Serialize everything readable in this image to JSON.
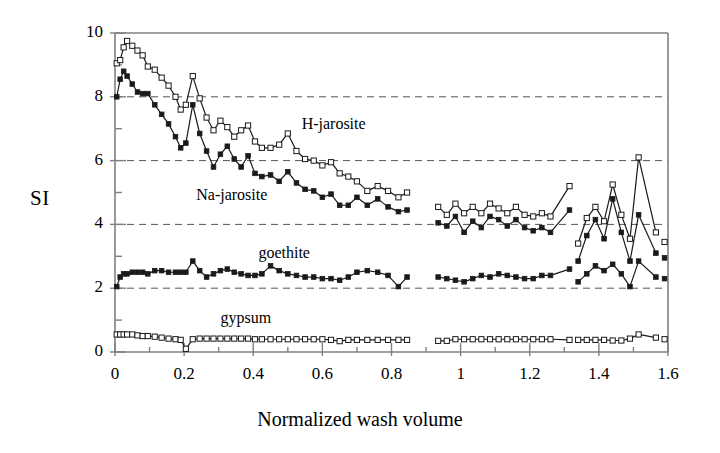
{
  "chart_data": {
    "type": "line",
    "title": "",
    "xlabel": "Normalized wash volume",
    "ylabel": "SI",
    "xlim": [
      0,
      1.6
    ],
    "ylim": [
      0,
      10
    ],
    "xticks": [
      0,
      0.1,
      0.2,
      0.3,
      0.4,
      0.5,
      0.6,
      0.7,
      0.8,
      0.9,
      1.0,
      1.1,
      1.2,
      1.3,
      1.4,
      1.5,
      1.6
    ],
    "xtick_labels": [
      "0",
      "",
      "0.2",
      "",
      "0.4",
      "",
      "0.6",
      "",
      "0.8",
      "",
      "1",
      "",
      "1.2",
      "",
      "1.4",
      "",
      "1.6"
    ],
    "yticks": [
      0,
      1,
      2,
      3,
      4,
      5,
      6,
      7,
      8,
      9,
      10
    ],
    "ytick_labels": [
      "0",
      "",
      "2",
      "",
      "4",
      "",
      "6",
      "",
      "8",
      "",
      "10"
    ],
    "grid": "horizontal dashed at y = 2, 4, 6, 8",
    "gridlines_y": [
      2,
      4,
      6,
      8
    ],
    "legend": "inline annotations next to each curve",
    "marker_note": "open squares = H-jarosite and gypsum; filled squares = Na-jarosite and goethite",
    "series": [
      {
        "name": "H-jarosite",
        "marker": "open-square",
        "label_x": 0.54,
        "label_y": 7.1,
        "x": [
          0.005,
          0.015,
          0.025,
          0.035,
          0.05,
          0.065,
          0.08,
          0.095,
          0.115,
          0.135,
          0.155,
          0.175,
          0.19,
          0.205,
          0.225,
          0.245,
          0.265,
          0.285,
          0.305,
          0.325,
          0.345,
          0.365,
          0.385,
          0.405,
          0.425,
          0.45,
          0.475,
          0.5,
          0.525,
          0.55,
          0.575,
          0.6,
          0.625,
          0.65,
          0.675,
          0.7,
          0.73,
          0.76,
          0.79,
          0.82,
          0.845,
          0.935,
          0.96,
          0.985,
          1.01,
          1.035,
          1.06,
          1.085,
          1.11,
          1.135,
          1.16,
          1.185,
          1.21,
          1.235,
          1.26,
          1.315,
          1.34,
          1.365,
          1.39,
          1.415,
          1.44,
          1.465,
          1.49,
          1.515,
          1.565,
          1.59
        ],
        "y": [
          9.05,
          9.15,
          9.55,
          9.75,
          9.6,
          9.45,
          9.3,
          8.95,
          8.85,
          8.6,
          8.35,
          8.0,
          7.6,
          7.75,
          8.65,
          7.95,
          7.35,
          6.95,
          7.25,
          7.05,
          6.75,
          6.95,
          7.1,
          6.6,
          6.4,
          6.4,
          6.5,
          6.85,
          6.3,
          6.05,
          6.0,
          5.85,
          5.95,
          5.6,
          5.5,
          5.35,
          5.05,
          5.2,
          5.05,
          4.85,
          5.0,
          4.55,
          4.3,
          4.65,
          4.35,
          4.55,
          4.35,
          4.65,
          4.5,
          4.35,
          4.55,
          4.3,
          4.25,
          4.35,
          4.25,
          5.2,
          3.4,
          4.2,
          4.55,
          4.1,
          5.25,
          4.3,
          3.55,
          6.1,
          3.75,
          3.45
        ]
      },
      {
        "name": "Na-jarosite",
        "marker": "filled-square",
        "label_x": 0.235,
        "label_y": 4.85,
        "x": [
          0.005,
          0.015,
          0.025,
          0.035,
          0.05,
          0.065,
          0.08,
          0.095,
          0.115,
          0.135,
          0.155,
          0.175,
          0.19,
          0.205,
          0.225,
          0.245,
          0.265,
          0.285,
          0.305,
          0.325,
          0.345,
          0.365,
          0.385,
          0.405,
          0.425,
          0.45,
          0.475,
          0.5,
          0.525,
          0.55,
          0.575,
          0.6,
          0.625,
          0.65,
          0.675,
          0.7,
          0.73,
          0.76,
          0.79,
          0.82,
          0.845,
          0.935,
          0.96,
          0.985,
          1.01,
          1.035,
          1.06,
          1.085,
          1.11,
          1.135,
          1.16,
          1.185,
          1.21,
          1.235,
          1.26,
          1.315,
          1.34,
          1.365,
          1.39,
          1.415,
          1.44,
          1.465,
          1.49,
          1.515,
          1.565,
          1.59
        ],
        "y": [
          8.0,
          8.55,
          8.8,
          8.65,
          8.4,
          8.15,
          8.1,
          8.1,
          7.75,
          7.45,
          7.15,
          6.75,
          6.4,
          6.55,
          7.75,
          6.85,
          6.3,
          5.8,
          6.2,
          6.45,
          6.05,
          5.8,
          6.15,
          5.6,
          5.5,
          5.55,
          5.35,
          5.65,
          5.3,
          5.1,
          5.05,
          4.85,
          4.95,
          4.6,
          4.6,
          4.85,
          4.6,
          4.8,
          4.55,
          4.4,
          4.45,
          4.05,
          3.95,
          4.25,
          3.75,
          4.1,
          3.9,
          4.25,
          4.15,
          3.95,
          4.15,
          3.9,
          3.8,
          3.9,
          3.75,
          4.45,
          2.85,
          3.65,
          4.15,
          3.55,
          4.8,
          3.75,
          2.85,
          4.3,
          3.1,
          2.95
        ]
      },
      {
        "name": "goethite",
        "marker": "filled-square",
        "label_x": 0.415,
        "label_y": 3.05,
        "x": [
          0.005,
          0.015,
          0.025,
          0.035,
          0.05,
          0.065,
          0.08,
          0.095,
          0.115,
          0.135,
          0.155,
          0.175,
          0.19,
          0.205,
          0.225,
          0.245,
          0.265,
          0.285,
          0.305,
          0.325,
          0.345,
          0.365,
          0.385,
          0.405,
          0.425,
          0.45,
          0.475,
          0.5,
          0.525,
          0.55,
          0.575,
          0.6,
          0.625,
          0.65,
          0.675,
          0.7,
          0.73,
          0.76,
          0.79,
          0.82,
          0.845,
          0.935,
          0.96,
          0.985,
          1.01,
          1.035,
          1.06,
          1.085,
          1.11,
          1.135,
          1.16,
          1.185,
          1.21,
          1.235,
          1.26,
          1.315,
          1.34,
          1.365,
          1.39,
          1.415,
          1.44,
          1.465,
          1.49,
          1.515,
          1.565,
          1.59
        ],
        "y": [
          2.05,
          2.35,
          2.45,
          2.45,
          2.5,
          2.5,
          2.5,
          2.45,
          2.55,
          2.55,
          2.5,
          2.5,
          2.5,
          2.5,
          2.85,
          2.55,
          2.35,
          2.45,
          2.55,
          2.6,
          2.5,
          2.45,
          2.4,
          2.4,
          2.45,
          2.7,
          2.55,
          2.45,
          2.4,
          2.35,
          2.35,
          2.3,
          2.3,
          2.25,
          2.35,
          2.5,
          2.55,
          2.5,
          2.4,
          2.05,
          2.35,
          2.35,
          2.3,
          2.25,
          2.2,
          2.3,
          2.4,
          2.35,
          2.45,
          2.4,
          2.35,
          2.3,
          2.3,
          2.4,
          2.4,
          2.6,
          2.2,
          2.45,
          2.7,
          2.55,
          2.75,
          2.45,
          2.05,
          2.85,
          2.35,
          2.3
        ]
      },
      {
        "name": "gypsum",
        "marker": "open-square",
        "label_x": 0.305,
        "label_y": 1.0,
        "x": [
          0.005,
          0.015,
          0.025,
          0.035,
          0.05,
          0.065,
          0.08,
          0.095,
          0.115,
          0.135,
          0.155,
          0.175,
          0.19,
          0.205,
          0.225,
          0.245,
          0.265,
          0.285,
          0.305,
          0.325,
          0.345,
          0.365,
          0.385,
          0.405,
          0.425,
          0.45,
          0.475,
          0.5,
          0.525,
          0.55,
          0.575,
          0.6,
          0.625,
          0.65,
          0.675,
          0.7,
          0.73,
          0.76,
          0.79,
          0.82,
          0.845,
          0.935,
          0.96,
          0.985,
          1.01,
          1.035,
          1.06,
          1.085,
          1.11,
          1.135,
          1.16,
          1.185,
          1.21,
          1.235,
          1.26,
          1.315,
          1.34,
          1.365,
          1.39,
          1.415,
          1.44,
          1.465,
          1.49,
          1.515,
          1.565,
          1.59
        ],
        "y": [
          0.55,
          0.55,
          0.55,
          0.55,
          0.55,
          0.52,
          0.5,
          0.5,
          0.48,
          0.45,
          0.42,
          0.4,
          0.38,
          0.1,
          0.4,
          0.42,
          0.42,
          0.42,
          0.42,
          0.42,
          0.42,
          0.42,
          0.42,
          0.4,
          0.4,
          0.4,
          0.4,
          0.4,
          0.4,
          0.4,
          0.4,
          0.4,
          0.38,
          0.34,
          0.38,
          0.38,
          0.38,
          0.38,
          0.38,
          0.38,
          0.38,
          0.35,
          0.35,
          0.4,
          0.4,
          0.4,
          0.4,
          0.4,
          0.4,
          0.4,
          0.4,
          0.4,
          0.4,
          0.4,
          0.4,
          0.38,
          0.38,
          0.38,
          0.38,
          0.38,
          0.36,
          0.36,
          0.42,
          0.55,
          0.45,
          0.4
        ]
      }
    ],
    "segment_breaks": [
      {
        "after_index": 40,
        "note": "gap between x=0.845 and x=0.935"
      },
      {
        "after_index": 55,
        "note": "gap between x=1.26 and x=1.315"
      },
      {
        "after_index": 64,
        "note": "gap between x=1.515 and x=1.565"
      }
    ]
  },
  "axes": {
    "y_title": "SI",
    "x_title": "Normalized wash volume",
    "x_labels": [
      "0",
      "0.2",
      "0.4",
      "0.6",
      "0.8",
      "1",
      "1.2",
      "1.4",
      "1.6"
    ],
    "y_labels": [
      "0",
      "2",
      "4",
      "6",
      "8",
      "10"
    ]
  },
  "annotations": {
    "h_jarosite": "H-jarosite",
    "na_jarosite": "Na-jarosite",
    "goethite": "goethite",
    "gypsum": "gypsum"
  },
  "colors": {
    "axis": "#808080",
    "grid": "#555555",
    "line": "#1a1a1a",
    "marker_fill_open": "#ffffff",
    "marker_fill_closed": "#1a1a1a",
    "background": "#ffffff"
  }
}
